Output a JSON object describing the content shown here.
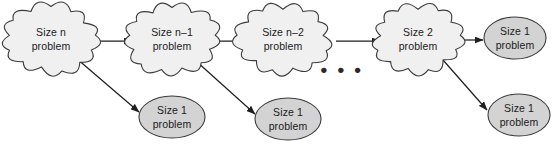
{
  "diagram": {
    "type": "flow-diagram",
    "colors": {
      "cloud_fill": "#f0f0f0",
      "ellipse_fill": "#d3d3d3",
      "shape_stroke": "#3b3b3b",
      "arrow": "#1f1f1f",
      "background": "#ffffff",
      "text": "#1a1a1a"
    },
    "ellipsis": "• • •",
    "nodes": [
      {
        "id": "cloud-size-n",
        "shape": "cloud",
        "line1": "Size n",
        "line2": "problem",
        "cx": 51,
        "cy": 39,
        "rx": 43,
        "ry": 31
      },
      {
        "id": "cloud-size-n-1",
        "shape": "cloud",
        "line1": "Size n–1",
        "line2": "problem",
        "cx": 172,
        "cy": 39,
        "rx": 43,
        "ry": 31
      },
      {
        "id": "cloud-size-n-2",
        "shape": "cloud",
        "line1": "Size n–2",
        "line2": "problem",
        "cx": 283,
        "cy": 39,
        "rx": 43,
        "ry": 31
      },
      {
        "id": "cloud-size-2",
        "shape": "cloud",
        "line1": "Size 2",
        "line2": "problem",
        "cx": 418,
        "cy": 39,
        "rx": 41,
        "ry": 30
      },
      {
        "id": "ellipse-base-1",
        "shape": "ellipse",
        "line1": "Size 1",
        "line2": "problem",
        "cx": 172,
        "cy": 117,
        "rx": 33,
        "ry": 21
      },
      {
        "id": "ellipse-base-2",
        "shape": "ellipse",
        "line1": "Size 1",
        "line2": "problem",
        "cx": 288,
        "cy": 119,
        "rx": 33,
        "ry": 21
      },
      {
        "id": "ellipse-base-3",
        "shape": "ellipse",
        "line1": "Size 1",
        "line2": "problem",
        "cx": 515,
        "cy": 38,
        "rx": 31,
        "ry": 21
      },
      {
        "id": "ellipse-base-4",
        "shape": "ellipse",
        "line1": "Size 1",
        "line2": "problem",
        "cx": 519,
        "cy": 115,
        "rx": 31,
        "ry": 21
      }
    ],
    "edges": [
      {
        "id": "edge-n-to-n1",
        "from": "cloud-size-n",
        "to": "cloud-size-n-1",
        "x1": 89,
        "y1": 41,
        "x2": 132,
        "y2": 41
      },
      {
        "id": "edge-n-to-base",
        "from": "cloud-size-n",
        "to": "ellipse-base-1",
        "x1": 76,
        "y1": 58,
        "x2": 139,
        "y2": 112
      },
      {
        "id": "edge-n1-to-n2",
        "from": "cloud-size-n-1",
        "to": "cloud-size-n-2",
        "x1": 211,
        "y1": 41,
        "x2": 245,
        "y2": 41
      },
      {
        "id": "edge-n1-to-base",
        "from": "cloud-size-n-1",
        "to": "ellipse-base-2",
        "x1": 196,
        "y1": 61,
        "x2": 255,
        "y2": 114
      },
      {
        "id": "edge-gap",
        "from": "ellipsis",
        "to": "cloud-size-2",
        "x1": 336,
        "y1": 41,
        "x2": 380,
        "y2": 41
      },
      {
        "id": "edge-2-to-base",
        "from": "cloud-size-2",
        "to": "ellipse-base-3",
        "x1": 457,
        "y1": 40,
        "x2": 483,
        "y2": 40
      },
      {
        "id": "edge-2-to-base2",
        "from": "cloud-size-2",
        "to": "ellipse-base-4",
        "x1": 443,
        "y1": 60,
        "x2": 487,
        "y2": 110
      }
    ],
    "ellipsis_position": {
      "cx": 342,
      "cy": 71
    }
  }
}
